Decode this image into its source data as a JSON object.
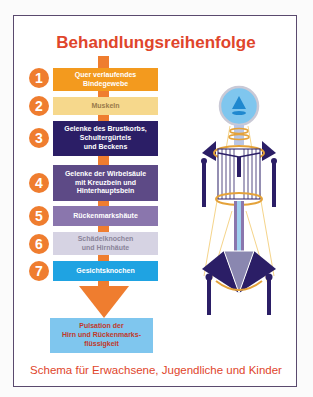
{
  "title": "Behandlungsreihenfolge",
  "footer": "Schema für Erwachsene, Jugendliche und Kinder",
  "colors": {
    "accent": "#ef7d2f",
    "title": "#e0452b",
    "frame": "#5a4a6e"
  },
  "steps": [
    {
      "number": "1",
      "label": "Quer verlaufendes\nBindegewebe",
      "bg": "#f39a1e",
      "fg": "#ffffff"
    },
    {
      "number": "2",
      "label": "Muskeln",
      "bg": "#f6d88c",
      "fg": "#9a7a4a"
    },
    {
      "number": "3",
      "label": "Gelenke des Brustkorbs,\nSchultergürtels\nund Beckens",
      "bg": "#2b1e66",
      "fg": "#ffffff"
    },
    {
      "number": "4",
      "label": "Gelenke der Wirbelsäule\nmit Kreuzbein und\nHinterhauptsbein",
      "bg": "#5d4a86",
      "fg": "#ffffff"
    },
    {
      "number": "5",
      "label": "Rückenmarkshäute",
      "bg": "#8a76ad",
      "fg": "#ffffff"
    },
    {
      "number": "6",
      "label": "Schädelknochen\nund Hirnhäute",
      "bg": "#d6d3e3",
      "fg": "#8a8499"
    },
    {
      "number": "7",
      "label": "Gesichtsknochen",
      "bg": "#1fa3e2",
      "fg": "#ffffff"
    }
  ],
  "result": "Pulsation der\nHirn und Rückenmarks-\nflüssigkeit",
  "figure": {
    "icons": [
      "skull-circle-icon",
      "shoulder-girdle-icon",
      "ribcage-icon",
      "pelvis-icon",
      "spinal-column-icon"
    ]
  }
}
